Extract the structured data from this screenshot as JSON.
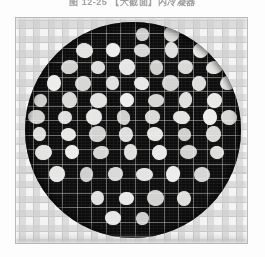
{
  "figure": {
    "caption": "图 12-25   【大截面】内冷凝器",
    "frame": {
      "x": 15,
      "y": 17,
      "width": 233,
      "height": 227,
      "border_color": "#b9b9b9",
      "background_color": "#f2f2f2"
    },
    "background": {
      "type": "graph-paper-checker",
      "grid_spacing_px": 14.5,
      "grid_line_color": "#969696",
      "checker_color": "#cdcdcd",
      "paper_color": "#f4f4f4"
    },
    "specimen": {
      "shape": "circle",
      "center_x": 117,
      "center_y": 112,
      "radius": 108,
      "fill_color": "#0d0d0d",
      "overlay_grid_color": "#bebebe",
      "overlay_grid_spacing_px": 14.5,
      "description": "dark circular specimen with staggered white perforation dots"
    },
    "dots": {
      "color": "#f0f0ee",
      "diameter_px": 15,
      "lattice": "staggered-hexagonal",
      "row_pitch_px": 29,
      "col_pitch_px": 29,
      "row_offset_px": 14.5,
      "count": 57,
      "positions": [
        [
          117,
          12
        ],
        [
          146,
          12
        ],
        [
          59,
          28
        ],
        [
          88,
          28
        ],
        [
          117,
          28
        ],
        [
          146,
          28
        ],
        [
          175,
          28
        ],
        [
          44,
          45
        ],
        [
          73,
          45
        ],
        [
          102,
          45
        ],
        [
          131,
          45
        ],
        [
          160,
          45
        ],
        [
          189,
          45
        ],
        [
          29,
          61
        ],
        [
          58,
          61
        ],
        [
          87,
          61
        ],
        [
          116,
          61
        ],
        [
          145,
          61
        ],
        [
          174,
          61
        ],
        [
          203,
          61
        ],
        [
          15,
          78
        ],
        [
          44,
          78
        ],
        [
          73,
          78
        ],
        [
          102,
          78
        ],
        [
          131,
          78
        ],
        [
          160,
          78
        ],
        [
          189,
          78
        ],
        [
          11,
          95
        ],
        [
          40,
          95
        ],
        [
          69,
          95
        ],
        [
          98,
          95
        ],
        [
          127,
          95
        ],
        [
          156,
          95
        ],
        [
          185,
          95
        ],
        [
          204,
          95
        ],
        [
          14,
          112
        ],
        [
          43,
          112
        ],
        [
          72,
          112
        ],
        [
          101,
          112
        ],
        [
          130,
          112
        ],
        [
          159,
          112
        ],
        [
          188,
          112
        ],
        [
          18,
          130
        ],
        [
          47,
          130
        ],
        [
          76,
          130
        ],
        [
          105,
          130
        ],
        [
          134,
          130
        ],
        [
          163,
          130
        ],
        [
          192,
          130
        ],
        [
          32,
          152
        ],
        [
          61,
          152
        ],
        [
          90,
          152
        ],
        [
          119,
          152
        ],
        [
          148,
          152
        ],
        [
          177,
          152
        ],
        [
          72,
          176
        ],
        [
          101,
          176
        ],
        [
          130,
          176
        ],
        [
          159,
          176
        ],
        [
          88,
          196
        ],
        [
          117,
          196
        ]
      ]
    }
  }
}
